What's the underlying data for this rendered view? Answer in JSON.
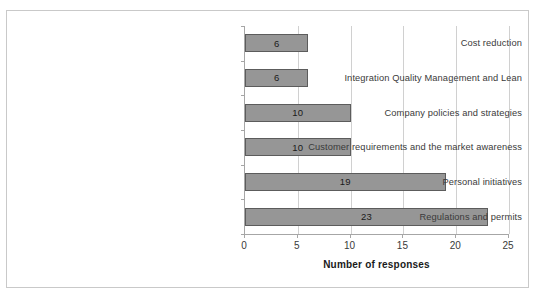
{
  "chart_data": {
    "type": "bar",
    "orientation": "horizontal",
    "title": "",
    "xlabel": "Number of responses",
    "ylabel": "",
    "xlim": [
      0,
      25
    ],
    "xticks": [
      0,
      5,
      10,
      15,
      20,
      25
    ],
    "grid": true,
    "legend": false,
    "bar_color": "#969696",
    "bar_border_color": "#5c5c5c",
    "categories": [
      "Cost reduction",
      "Integration Quality Management and Lean",
      "Company policies and strategies",
      "Customer requirements and the market awareness",
      "Personal initiatives",
      "Regulations and permits"
    ],
    "values": [
      6,
      6,
      10,
      10,
      19,
      23
    ],
    "data_labels": [
      "6",
      "6",
      "10",
      "10",
      "19",
      "23"
    ]
  }
}
